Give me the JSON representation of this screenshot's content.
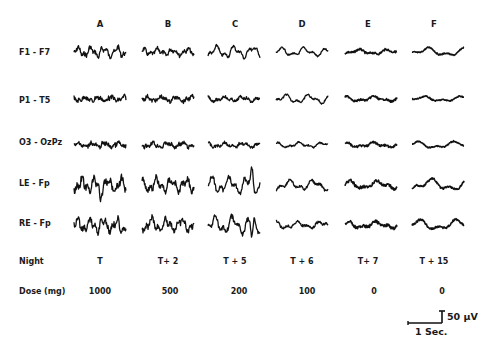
{
  "columns": [
    "A",
    "B",
    "C",
    "D",
    "E",
    "F"
  ],
  "channels": [
    "F1 - F7",
    "P1 - T5",
    "O3 - OzPz",
    "LE - Fp",
    "RE - Fp"
  ],
  "night": {
    "label": "Night",
    "values": [
      "T",
      "T+ 2",
      "T + 5",
      "T + 6",
      "T+ 7",
      "T + 15"
    ]
  },
  "dose": {
    "label": "Dose  (mg)",
    "values": [
      "1000",
      "500",
      "200",
      "100",
      "0",
      "0"
    ]
  },
  "scale_bar": {
    "amplitude": "50  µV",
    "time": "1 Sec."
  },
  "colors": {
    "trace": "#111111",
    "background": "#ffffff"
  }
}
